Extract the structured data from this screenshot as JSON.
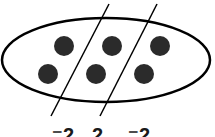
{
  "diagram": {
    "ellipse": {
      "cx": 106,
      "cy": 60,
      "rx": 104,
      "ry": 42,
      "stroke": "#000000"
    },
    "dots": [
      {
        "cx": 64,
        "cy": 46,
        "r": 10
      },
      {
        "cx": 112,
        "cy": 46,
        "r": 10
      },
      {
        "cx": 160,
        "cy": 46,
        "r": 10
      },
      {
        "cx": 48,
        "cy": 74,
        "r": 10
      },
      {
        "cx": 96,
        "cy": 74,
        "r": 10
      },
      {
        "cx": 144,
        "cy": 74,
        "r": 10
      }
    ],
    "dot_color": "#2b2b2b",
    "divider_lines": [
      {
        "x1": 109,
        "y1": 4,
        "x2": 51,
        "y2": 116
      },
      {
        "x1": 157,
        "y1": 4,
        "x2": 100,
        "y2": 116
      }
    ],
    "labels": [
      {
        "text": "⁻2",
        "x": 52
      },
      {
        "text": "2",
        "x": 92
      },
      {
        "text": "⁻2",
        "x": 128
      }
    ]
  }
}
